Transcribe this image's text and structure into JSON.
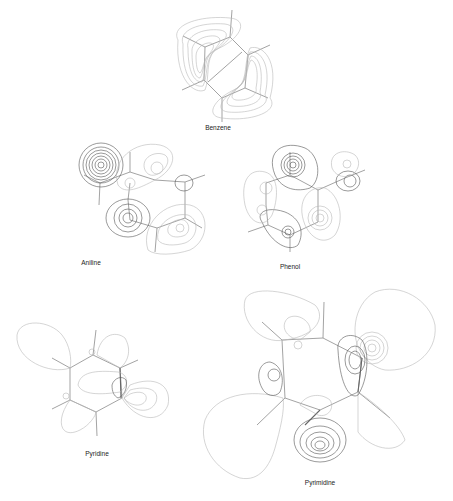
{
  "figure": {
    "panels": [
      {
        "id": "benzene",
        "label": "Benzene"
      },
      {
        "id": "aniline",
        "label": "Aniline"
      },
      {
        "id": "phenol",
        "label": "Phenol"
      },
      {
        "id": "pyridine",
        "label": "Pyridine"
      },
      {
        "id": "pyrimidine",
        "label": "Pyrimidine"
      }
    ]
  }
}
